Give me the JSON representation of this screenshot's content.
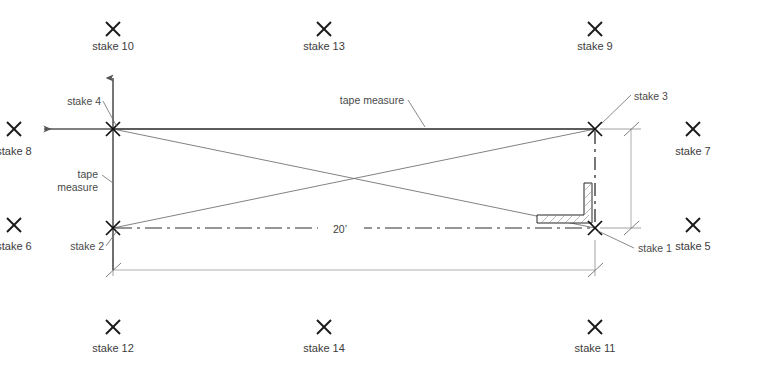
{
  "diagram": {
    "dimension_labels": [
      {
        "id": "width-20",
        "text": "20’",
        "x": 340,
        "y": 234
      }
    ],
    "annotations": [
      {
        "id": "tape-measure-top",
        "text": "tape measure",
        "x": 353,
        "y": 104
      },
      {
        "id": "tape-measure-left-line1",
        "text": "tape",
        "x": 85,
        "y": 178
      },
      {
        "id": "tape-measure-left-line2",
        "text": "measure",
        "x": 85,
        "y": 191
      }
    ],
    "corner_stakes": [
      {
        "id": "stake-4",
        "label": "stake 4",
        "point_x": 113,
        "point_y": 129,
        "label_x": 84,
        "label_y": 104
      },
      {
        "id": "stake-3",
        "label": "stake 3",
        "point_x": 595,
        "point_y": 129,
        "label_x": 638,
        "label_y": 101
      },
      {
        "id": "stake-2",
        "label": "stake 2",
        "point_x": 113,
        "point_y": 228,
        "label_x": 84,
        "label_y": 250
      },
      {
        "id": "stake-1",
        "label": "stake 1",
        "point_x": 595,
        "point_y": 228,
        "label_x": 641,
        "label_y": 252
      }
    ],
    "outer_stakes": [
      {
        "id": "stake-10",
        "label": "stake 10",
        "x": 113,
        "y": 29,
        "label_x": 113,
        "label_y": 50,
        "anchor": "middle"
      },
      {
        "id": "stake-13",
        "label": "stake 13",
        "x": 324,
        "y": 29,
        "label_x": 324,
        "label_y": 50,
        "anchor": "middle"
      },
      {
        "id": "stake-9",
        "label": "stake 9",
        "x": 595,
        "y": 29,
        "label_x": 595,
        "label_y": 50,
        "anchor": "middle"
      },
      {
        "id": "stake-8",
        "label": "stake 8",
        "x": 14,
        "y": 129,
        "label_x": 14,
        "label_y": 155,
        "anchor": "middle"
      },
      {
        "id": "stake-7",
        "label": "stake 7",
        "x": 693,
        "y": 129,
        "label_x": 693,
        "label_y": 155,
        "anchor": "middle"
      },
      {
        "id": "stake-6",
        "label": "stake 6",
        "x": 14,
        "y": 225,
        "label_x": 14,
        "label_y": 250,
        "anchor": "middle"
      },
      {
        "id": "stake-5",
        "label": "stake 5",
        "x": 693,
        "y": 225,
        "label_x": 693,
        "label_y": 250,
        "anchor": "middle"
      },
      {
        "id": "stake-12",
        "label": "stake 12",
        "x": 113,
        "y": 327,
        "label_x": 113,
        "label_y": 352,
        "anchor": "middle"
      },
      {
        "id": "stake-14",
        "label": "stake 14",
        "x": 324,
        "y": 327,
        "label_x": 324,
        "label_y": 352,
        "anchor": "middle"
      },
      {
        "id": "stake-11",
        "label": "stake 11",
        "x": 595,
        "y": 327,
        "label_x": 595,
        "label_y": 352,
        "anchor": "middle"
      }
    ],
    "colors": {
      "background": "#ffffff",
      "stake_mark": "#1c1c1c",
      "label_text": "#3c3c3c",
      "tape_line": "#3a3a3a",
      "diagonal_line": "#6b6b6b",
      "dimension_line": "#9a9a9a",
      "wall_outline": "#262626"
    },
    "geometry": {
      "layout_rect": {
        "left": 113,
        "top": 129,
        "right": 595,
        "bottom": 228
      },
      "axis_vertical": {
        "x": 113,
        "top": 72,
        "bottom": 270
      },
      "axis_horizontal": {
        "y": 129,
        "left": 38,
        "right": 595
      },
      "dim_bottom": {
        "y": 270,
        "left": 113,
        "right": 595
      },
      "dim_right": {
        "x": 631,
        "top": 129,
        "bottom": 228
      }
    }
  }
}
